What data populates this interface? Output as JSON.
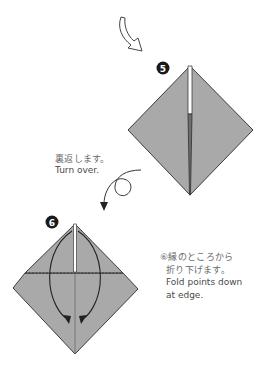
{
  "steps": [
    {
      "number": "5",
      "badge_center": [
        163,
        68
      ]
    },
    {
      "number": "6",
      "badge_center": [
        52,
        222
      ]
    }
  ],
  "turn_over": {
    "jp": "裏返します。",
    "en": "Turn over."
  },
  "step6_caption": {
    "jp_line1": "⑥縁のところから",
    "jp_line2": "折り下げます。",
    "en_line1": "Fold points down",
    "en_line2": "at edge."
  },
  "icons": [
    "curved-arrow-icon",
    "turn-over-arrow-icon",
    "fold-arrow-icon"
  ],
  "colors": {
    "paper": "#a9a9a9",
    "outline": "#3c3c3c",
    "slit": "#ffffff",
    "badge": "#1a1a1a",
    "text": "#4a4a4a"
  }
}
